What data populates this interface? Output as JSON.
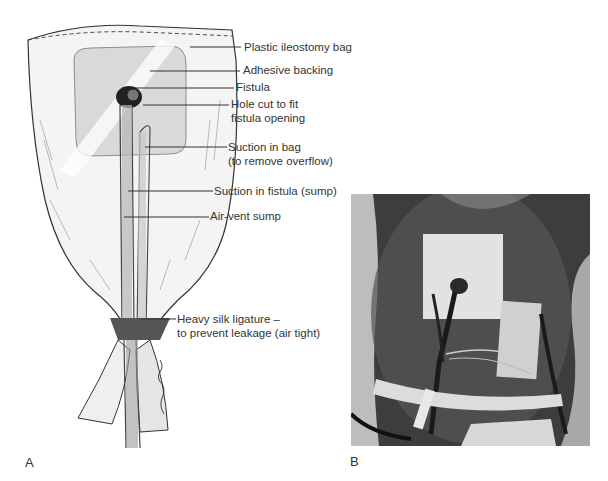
{
  "figure": {
    "panel_a": {
      "letter": "A",
      "description": "Line drawing of plastic ileostomy bag applied over fistula with sump drains",
      "labels": [
        {
          "id": "plastic-ileostomy-bag",
          "lines": [
            "Plastic ileostomy bag"
          ]
        },
        {
          "id": "adhesive-backing",
          "lines": [
            "Adhesive backing"
          ]
        },
        {
          "id": "fistula",
          "lines": [
            "Fistula"
          ]
        },
        {
          "id": "hole-cut",
          "lines": [
            "Hole cut to fit",
            "fistula opening"
          ]
        },
        {
          "id": "suction-in-bag",
          "lines": [
            "Suction in bag",
            "(to remove overflow)"
          ]
        },
        {
          "id": "suction-in-fistula",
          "lines": [
            "Suction in fistula (sump)"
          ]
        },
        {
          "id": "air-vent-sump",
          "lines": [
            "Air-vent sump"
          ]
        },
        {
          "id": "heavy-silk-ligature",
          "lines": [
            "Heavy silk ligature –",
            "to prevent leakage (air tight)"
          ]
        }
      ]
    },
    "panel_b": {
      "letter": "B",
      "description": "Black and white clinical photograph of applied fistula drainage bag on patient abdomen"
    }
  }
}
